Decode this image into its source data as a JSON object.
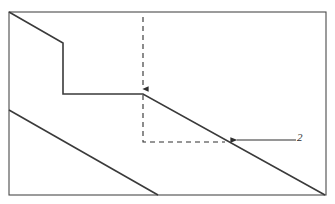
{
  "figure": {
    "background_color": "#ffffff",
    "line_color": "#3a3a3a",
    "border_color": "#4a4a4a",
    "frame": {
      "x": 9,
      "y": 12,
      "width": 317,
      "height": 183
    }
  },
  "annotations": {
    "callout_2": {
      "label": "2",
      "target_x": 235,
      "target_y": 140,
      "leader_start_x": 296,
      "leader_start_y": 140
    }
  },
  "chart_data": {
    "type": "line",
    "title": "",
    "xlabel": "",
    "ylabel": "",
    "grid": false,
    "legend": null,
    "axis_note": "unlabeled schematic plot; coordinates given in pixel space of the framed plot area",
    "xlim": [
      9,
      326
    ],
    "ylim": [
      195,
      12
    ],
    "series": [
      {
        "name": "upper-step-curve",
        "style": "solid",
        "points": [
          [
            9,
            12
          ],
          [
            63,
            43
          ],
          [
            63,
            94
          ],
          [
            143,
            94
          ],
          [
            325,
            195
          ]
        ]
      },
      {
        "name": "lower-diagonal",
        "style": "solid",
        "points": [
          [
            9,
            110
          ],
          [
            158,
            195
          ]
        ]
      },
      {
        "name": "vertical-drop-indicator",
        "style": "dashed-arrow",
        "points": [
          [
            143,
            17
          ],
          [
            143,
            94
          ]
        ]
      },
      {
        "name": "offset-corner-guide",
        "style": "dashed",
        "points": [
          [
            143,
            95
          ],
          [
            143,
            142
          ],
          [
            225,
            142
          ]
        ]
      }
    ]
  }
}
